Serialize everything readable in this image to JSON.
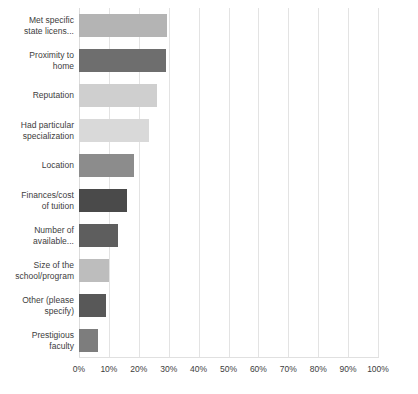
{
  "chart_data": {
    "type": "bar",
    "orientation": "horizontal",
    "title": "",
    "subtitle": "",
    "xlabel": "",
    "ylabel": "",
    "xlim": [
      0,
      100
    ],
    "xtick_labels": [
      "0%",
      "10%",
      "20%",
      "30%",
      "40%",
      "50%",
      "60%",
      "70%",
      "80%",
      "90%",
      "100%"
    ],
    "xtick_values": [
      0,
      10,
      20,
      30,
      40,
      50,
      60,
      70,
      80,
      90,
      100
    ],
    "grid": true,
    "grid_axis": "x",
    "legend": false,
    "legend_position": "none",
    "value_unit": "percent",
    "categories": [
      "Met specific state licens...",
      "Proximity to home",
      "Reputation",
      "Had particular specialization",
      "Location",
      "Finances/cost of tuition",
      "Number of available...",
      "Size of the school/program",
      "Other (please specify)",
      "Prestigious faculty"
    ],
    "values": [
      29.5,
      29.0,
      26.0,
      23.5,
      18.5,
      16.0,
      13.0,
      10.0,
      9.0,
      6.5
    ],
    "bar_colors": [
      "#b4b4b4",
      "#6e6e6e",
      "#cfcfcf",
      "#d9d9d9",
      "#8c8c8c",
      "#4a4a4a",
      "#5e5e5e",
      "#bdbdbd",
      "#585858",
      "#7d7d7d"
    ]
  },
  "axis": {
    "grid_color": "#e3e3e3",
    "label_color": "#3d3d3d"
  },
  "categories_wrapped": [
    [
      "Met specific",
      "state licens..."
    ],
    [
      "Proximity to",
      "home"
    ],
    [
      "Reputation"
    ],
    [
      "Had particular",
      "specialization"
    ],
    [
      "Location"
    ],
    [
      "Finances/cost",
      "of tuition"
    ],
    [
      "Number of",
      "available..."
    ],
    [
      "Size of the",
      "school/program"
    ],
    [
      "Other (please",
      "specify)"
    ],
    [
      "Prestigious",
      "faculty"
    ]
  ]
}
